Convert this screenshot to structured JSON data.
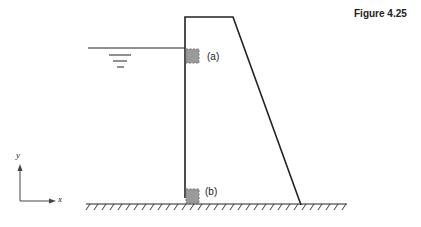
{
  "figure": {
    "label": "Figure 4.25"
  },
  "points": {
    "a": {
      "label": "(a)"
    },
    "b": {
      "label": "(b)"
    }
  },
  "axes": {
    "x_label": "x",
    "y_label": "y"
  },
  "colors": {
    "stroke": "#222222",
    "element_fill": "#9a9a9a",
    "element_border": "#777777"
  }
}
